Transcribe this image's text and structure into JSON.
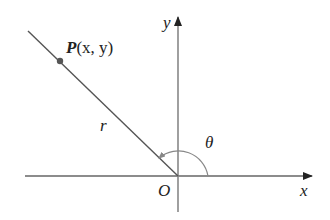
{
  "diagram": {
    "type": "polar-coordinates",
    "point_label": "P",
    "point_coords": "(x, y)",
    "radius_label": "r",
    "angle_label": "θ",
    "origin_label": "O",
    "x_axis_label": "x",
    "y_axis_label": "y",
    "colors": {
      "axis": "#666666",
      "ray": "#555555",
      "point": "#555555",
      "arc": "#888888",
      "text": "#222222"
    }
  }
}
